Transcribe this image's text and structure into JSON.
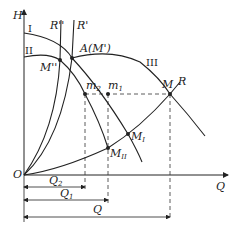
{
  "diagram": {
    "axes": {
      "y_label": "H",
      "x_label": "Q",
      "origin_label": "O"
    },
    "curves": {
      "I": "I",
      "II": "II",
      "III": "III",
      "R": "R",
      "R_prime": "R'",
      "R_double_prime": "R''"
    },
    "points": {
      "A": "A(M')",
      "M_double_prime": "M''",
      "m1": "m",
      "m1_sub": "1",
      "m2": "m",
      "m2_sub": "2",
      "M": "M",
      "M_I": "M",
      "M_I_sub": "I",
      "M_II": "M",
      "M_II_sub": "II"
    },
    "dimensions": {
      "Q2": "Q",
      "Q2_sub": "2",
      "Q1": "Q",
      "Q1_sub": "1",
      "Q": "Q"
    },
    "colors": {
      "line": "#222222",
      "background": "#ffffff"
    }
  }
}
